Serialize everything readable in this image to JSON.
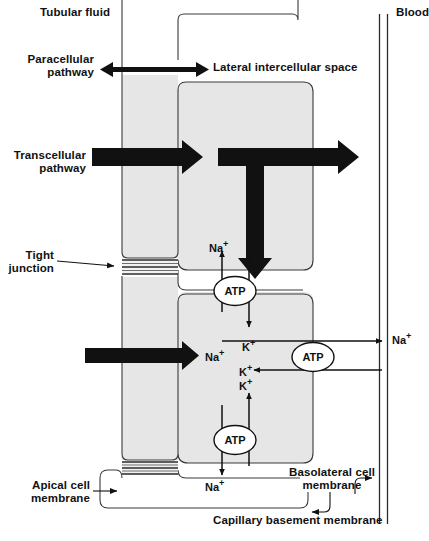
{
  "diagram": {
    "colors": {
      "cell_fill": "#e6e6e6",
      "outline": "#3a3a3a",
      "arrow_black": "#111111",
      "background": "#ffffff",
      "text": "#111111"
    },
    "labels": {
      "tubular_fluid": "Tubular fluid",
      "blood": "Blood",
      "paracellular_pathway": "Paracellular\npathway",
      "lateral_intercellular_space": "Lateral intercellular space",
      "transcellular_pathway": "Transcellular\npathway",
      "tight_junction": "Tight\njunction",
      "apical_cell_membrane": "Apical cell\nmembrane",
      "basolateral_cell_membrane": "Basolateral cell\nmembrane",
      "capillary_basement_membrane": "Capillary basement membrane"
    },
    "pumps": [
      {
        "name": "apical-sodium-potassium-pump",
        "label": "ATP",
        "cx": 235,
        "cy": 291
      },
      {
        "name": "basolateral-sodium-potassium-pump",
        "label": "ATP",
        "cx": 313,
        "cy": 357
      },
      {
        "name": "lower-apical-sodium-potassium-pump",
        "label": "ATP",
        "cx": 235,
        "cy": 440
      }
    ],
    "ions": [
      {
        "name": "sodium-out-apical-upper",
        "label": "Na",
        "charge": "+",
        "x": 209,
        "y": 239,
        "direction": "up"
      },
      {
        "name": "potassium-in-apical-upper",
        "label": "K",
        "charge": "+",
        "x": 240,
        "y": 338,
        "direction": "down"
      },
      {
        "name": "sodium-influx-transport",
        "label": "Na",
        "charge": "+",
        "x": 205,
        "y": 352,
        "direction": "right"
      },
      {
        "name": "sodium-out-basolateral",
        "label": "Na",
        "charge": "+",
        "x": 390,
        "y": 337,
        "direction": "right"
      },
      {
        "name": "potassium-in-basolateral",
        "label": "K",
        "charge": "+",
        "x": 238,
        "y": 374,
        "direction": "left"
      },
      {
        "name": "potassium-out-apical-lower",
        "label": "K",
        "charge": "+",
        "x": 240,
        "y": 381,
        "direction": "up"
      },
      {
        "name": "sodium-in-apical-lower",
        "label": "Na",
        "charge": "+",
        "x": 205,
        "y": 482,
        "direction": "down"
      }
    ]
  }
}
